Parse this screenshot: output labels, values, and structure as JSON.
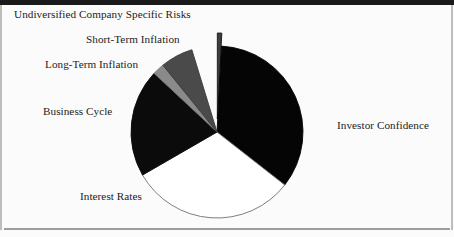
{
  "figure": {
    "background_color": "#fbfbfb",
    "frame_color": "#1a1a1a",
    "rule_color": "#9d9d9d"
  },
  "chart_data": {
    "type": "pie",
    "title": "",
    "subtitle": "",
    "xlabel": "",
    "ylabel": "",
    "grid": false,
    "legend_position": "none",
    "label_placement": "outside-no-leader",
    "start_angle_deg": 0,
    "direction": "clockwise",
    "center": {
      "x": 217,
      "y": 132
    },
    "radius": 86,
    "categories": [
      "Undiversified Company Specific Risks",
      "Investor Confidence",
      "Interest Rates",
      "Business Cycle",
      "Long-Term Inflation",
      "Short-Term Inflation"
    ],
    "values": [
      3,
      125,
      112,
      73,
      8,
      22
    ],
    "value_unit": "degrees",
    "percentages": [
      0.8,
      34.7,
      31.1,
      20.3,
      2.2,
      6.1
    ],
    "slices": [
      {
        "label": "Undiversified Company Specific Risks",
        "degrees": 3,
        "percent": 0.8,
        "color": "#3d3d3d",
        "edge_color": "#1a1a1a",
        "exploded": true,
        "explode_offset": 13
      },
      {
        "label": "Investor Confidence",
        "degrees": 125,
        "percent": 34.7,
        "color": "#050505",
        "edge_color": "#050505",
        "exploded": false,
        "explode_offset": 0
      },
      {
        "label": "Interest Rates",
        "degrees": 112,
        "percent": 31.1,
        "color": "#ffffff",
        "edge_color": "#6f6f6f",
        "exploded": false,
        "explode_offset": 0
      },
      {
        "label": "Business Cycle",
        "degrees": 73,
        "percent": 20.3,
        "color": "#0b0b0b",
        "edge_color": "#0b0b0b",
        "exploded": false,
        "explode_offset": 0
      },
      {
        "label": "Long-Term Inflation",
        "degrees": 8,
        "percent": 2.2,
        "color": "#8a8a8a",
        "edge_color": "#6f6f6f",
        "exploded": false,
        "explode_offset": 0
      },
      {
        "label": "Short-Term Inflation",
        "degrees": 22,
        "percent": 6.1,
        "color": "#4a4a4a",
        "edge_color": "#3a3a3a",
        "exploded": false,
        "explode_offset": 0
      }
    ]
  },
  "labels": {
    "undiversified": "Undiversified Company Specific Risks",
    "short_term": "Short-Term Inflation",
    "long_term": "Long-Term Inflation",
    "business_cycle": "Business Cycle",
    "interest_rates": "Interest Rates",
    "investor_confidence": "Investor Confidence"
  }
}
